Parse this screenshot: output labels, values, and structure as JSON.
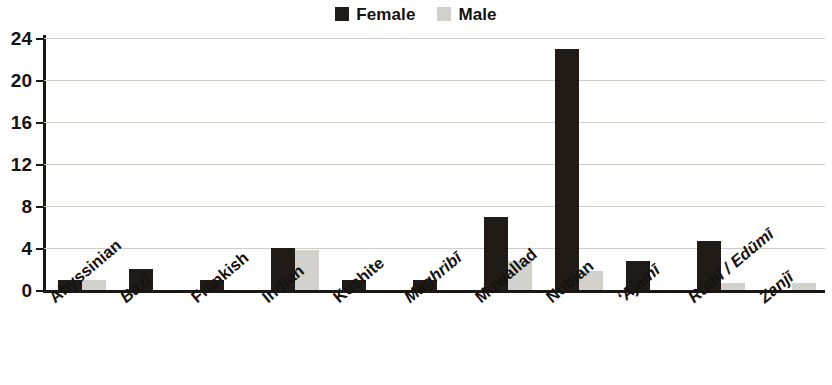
{
  "chart_data": {
    "type": "bar",
    "title": "",
    "subtitle": "",
    "xlabel": "",
    "ylabel": "",
    "ylim": [
      0,
      24
    ],
    "yticks": [
      0,
      4,
      8,
      12,
      16,
      20,
      24
    ],
    "ytick_labels": [
      "0",
      "4",
      "8",
      "12",
      "16",
      "20",
      "24"
    ],
    "grid": "horizontal",
    "legend_position": "top-center",
    "categories": [
      "Abyssinian",
      "Bāzī",
      "Frankish",
      "Indian",
      "Kushite",
      "Maghribī",
      "Muwallad",
      "Nubian",
      "ʻAjamī",
      "Rūmī / Edūmī",
      "Zanjī"
    ],
    "category_styles": [
      "normal",
      "italic",
      "normal",
      "normal",
      "normal",
      "italic",
      "normal",
      "normal",
      "italic",
      "italic",
      "italic"
    ],
    "series": [
      {
        "name": "Female",
        "color": "#201b17",
        "values": [
          1,
          2,
          1,
          4,
          1,
          1,
          7,
          23,
          2.8,
          4.7,
          0
        ]
      },
      {
        "name": "Male",
        "color": "#d2d1cb",
        "values": [
          1,
          0,
          0,
          3.8,
          0,
          0,
          2.8,
          1.8,
          0,
          0.7,
          0.7
        ]
      }
    ]
  },
  "legend": {
    "entries": [
      {
        "label": "Female",
        "color": "#201b17",
        "icon": "square-swatch-icon"
      },
      {
        "label": "Male",
        "color": "#d2d1cb",
        "icon": "square-swatch-icon"
      }
    ]
  },
  "colors": {
    "female": "#201b17",
    "male": "#d2d1cb",
    "axis": "#1b1714",
    "gridline": "#cfccc6",
    "background": "#ffffff",
    "text": "#151210"
  }
}
